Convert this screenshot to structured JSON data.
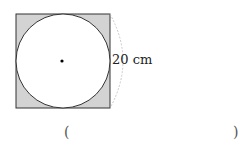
{
  "figure": {
    "square": {
      "x": 16,
      "y": 14,
      "size": 94,
      "fill": "#d3d3d3",
      "stroke": "#333333"
    },
    "circle": {
      "cx": 63,
      "cy": 61,
      "r": 47,
      "fill": "#ffffff",
      "stroke": "#333333"
    },
    "center_dot": {
      "cx": 62,
      "cy": 61,
      "r": 1.6,
      "color": "#000000"
    },
    "dimension_arc": {
      "color": "#bbbbbb"
    },
    "dimension_label": "20 cm"
  },
  "answer": {
    "open_paren": "(",
    "close_paren": ")"
  }
}
